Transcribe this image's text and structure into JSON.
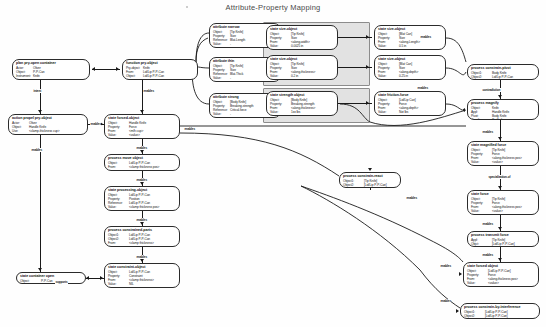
{
  "title": "Attribute-Property Mapping",
  "groups": [
    {
      "name": "mass-size-group",
      "x": 263,
      "y": 22,
      "w": 105,
      "h": 62
    },
    {
      "name": "strength-force-group",
      "x": 263,
      "y": 88,
      "w": 105,
      "h": 33
    }
  ],
  "nodes": [
    {
      "id": "plan-pry-open-container",
      "header": "plan pry-open container",
      "x": 12,
      "y": 59,
      "w": 78,
      "h": 21,
      "narrow": true,
      "slots": [
        {
          "key": "Actor:",
          "value": "Oliver"
        },
        {
          "key": "Object:",
          "value": "P-P-Can"
        },
        {
          "key": "Instrument:",
          "value": "Knife"
        }
      ]
    },
    {
      "id": "function-pry-object",
      "header": "function pry-object",
      "x": 122,
      "y": 59,
      "w": 76,
      "h": 21,
      "narrow": true,
      "slots": [
        {
          "key": "Pry-object:",
          "value": "Knife"
        },
        {
          "key": "From:",
          "value": "Lid/Lip P-P-Can"
        },
        {
          "key": "Object:",
          "value": "Lid/Lip P-P-Can"
        }
      ]
    },
    {
      "id": "action-propel-pry-object",
      "header": "action propel pry-object",
      "x": 8,
      "y": 114,
      "w": 80,
      "h": 21,
      "narrow": true,
      "slots": [
        {
          "key": "Actor:",
          "value": "Oliver"
        },
        {
          "key": "Object:",
          "value": "Handle Knife"
        },
        {
          "key": "Use:",
          "value": "&lt;clamp-thickness cup&gt;"
        }
      ]
    },
    {
      "id": "state-forced-object",
      "header": "state forced-object",
      "x": 104,
      "y": 114,
      "w": 76,
      "h": 25,
      "slots": [
        {
          "key": "Object:",
          "value": "Handle Knife"
        },
        {
          "key": "Property:",
          "value": "Force"
        },
        {
          "key": "From:",
          "value": "&lt;m/h cup&gt;"
        },
        {
          "key": "Value:",
          "value": "&lt;value&gt;"
        }
      ]
    },
    {
      "id": "process-move-object",
      "header": "process move object",
      "x": 104,
      "y": 154,
      "w": 76,
      "h": 17,
      "slots": [
        {
          "key": "Object:",
          "value": "Lid/Lip P-P-Can"
        },
        {
          "key": "From:",
          "value": "&lt;clamp thickness pos&gt;"
        }
      ]
    },
    {
      "id": "state-processing-object",
      "header": "state processing-object",
      "x": 104,
      "y": 186,
      "w": 76,
      "h": 25,
      "slots": [
        {
          "key": "Object:",
          "value": "Lid/Lip P-P-Can"
        },
        {
          "key": "Property:",
          "value": "Position"
        },
        {
          "key": "Reference:",
          "value": "Lid/Lip P-P-Can"
        },
        {
          "key": "Value:",
          "value": "&lt;clamp thickness pos&gt;"
        }
      ]
    },
    {
      "id": "process-constrained-parts",
      "header": "process constrained-parts",
      "x": 104,
      "y": 226,
      "w": 76,
      "h": 21,
      "slots": [
        {
          "key": "Object1:",
          "value": "Lid/Lip P-P-Can"
        },
        {
          "key": "Object2:",
          "value": "Lid/Lip P-P-Can"
        },
        {
          "key": "From:",
          "value": "&lt;clamp thickness&gt;"
        }
      ]
    },
    {
      "id": "state-constraint-object",
      "header": "state constraint-object",
      "x": 104,
      "y": 263,
      "w": 76,
      "h": 25,
      "slots": [
        {
          "key": "Object:",
          "value": "Lid/Lip P-P-Can"
        },
        {
          "key": "Property:",
          "value": "Constraint"
        },
        {
          "key": "From:",
          "value": "&lt;clamp thickness&gt;"
        },
        {
          "key": "Value:",
          "value": "NIL"
        }
      ]
    },
    {
      "id": "state-container-open",
      "header": "state container open",
      "x": 16,
      "y": 272,
      "w": 70,
      "h": 12,
      "slots": [
        {
          "key": "Object:",
          "value": "P-P-Can"
        }
      ]
    },
    {
      "id": "attribute-narrow",
      "header": "attribute narrow",
      "x": 209,
      "y": 23,
      "w": 72,
      "h": 25,
      "narrow": true,
      "slots": [
        {
          "key": "Object:",
          "value": "[Tip Knife]"
        },
        {
          "key": "Property:",
          "value": "Size"
        },
        {
          "key": "Reference:",
          "value": "Blat-Length"
        },
        {
          "key": "Value:",
          "value": "-"
        }
      ]
    },
    {
      "id": "attribute-thin",
      "header": "attribute thin",
      "x": 209,
      "y": 57,
      "w": 72,
      "h": 25,
      "narrow": true,
      "slots": [
        {
          "key": "Object:",
          "value": "[Tip Knife]"
        },
        {
          "key": "Property:",
          "value": "Size"
        },
        {
          "key": "Reference:",
          "value": "Blat-Thick"
        },
        {
          "key": "Value:",
          "value": "-"
        }
      ]
    },
    {
      "id": "attribute-strong",
      "header": "attribute strong",
      "x": 209,
      "y": 93,
      "w": 72,
      "h": 25,
      "narrow": true,
      "slots": [
        {
          "key": "Object:",
          "value": "[Body Knife]"
        },
        {
          "key": "Property:",
          "value": "Breaking-strength"
        },
        {
          "key": "Reference:",
          "value": "Critical-force"
        },
        {
          "key": "Value:",
          "value": "-"
        }
      ]
    },
    {
      "id": "state-size-object-1",
      "header": "state size-object",
      "x": 266,
      "y": 25,
      "w": 72,
      "h": 25,
      "slots": [
        {
          "key": "Object:",
          "value": "[Tip Knife]"
        },
        {
          "key": "Property:",
          "value": "Size"
        },
        {
          "key": "From:",
          "value": "&lt;along-width&gt;"
        },
        {
          "key": "Value:",
          "value": "0.0025 in"
        }
      ]
    },
    {
      "id": "state-size-object-2",
      "header": "state size-object",
      "x": 266,
      "y": 55,
      "w": 72,
      "h": 25,
      "slots": [
        {
          "key": "Object:",
          "value": "[Tip Knife]"
        },
        {
          "key": "Property:",
          "value": "Size"
        },
        {
          "key": "From:",
          "value": "&lt;along-thickness&gt;"
        },
        {
          "key": "Value:",
          "value": "0.2 in"
        }
      ]
    },
    {
      "id": "state-size-object-3",
      "header": "state size-object",
      "x": 374,
      "y": 25,
      "w": 72,
      "h": 25,
      "slots": [
        {
          "key": "Object:",
          "value": "[Blat Can]"
        },
        {
          "key": "Property:",
          "value": "Size"
        },
        {
          "key": "From:",
          "value": "&lt;along-Length&gt;"
        },
        {
          "key": "Value:",
          "value": "0.5 in"
        }
      ]
    },
    {
      "id": "state-size-object-4",
      "header": "state size-object",
      "x": 374,
      "y": 55,
      "w": 72,
      "h": 25,
      "slots": [
        {
          "key": "Object:",
          "value": "[Blat Can]"
        },
        {
          "key": "Property:",
          "value": "Size"
        },
        {
          "key": "From:",
          "value": "&lt;along-depth&gt;"
        },
        {
          "key": "Value:",
          "value": "0.25 in"
        }
      ]
    },
    {
      "id": "state-strength-object",
      "header": "state strength object",
      "x": 266,
      "y": 91,
      "w": 72,
      "h": 25,
      "slots": [
        {
          "key": "Object:",
          "value": "[Body Knife]"
        },
        {
          "key": "Property:",
          "value": "Breaking-strength"
        },
        {
          "key": "From:",
          "value": "&lt;along-thickness&gt;"
        },
        {
          "key": "Value:",
          "value": "1xx lbs"
        }
      ]
    },
    {
      "id": "state-friction-force",
      "header": "state friction-force",
      "x": 374,
      "y": 91,
      "w": 72,
      "h": 25,
      "slots": [
        {
          "key": "Object:",
          "value": "[Lid/Lip Can]"
        },
        {
          "key": "Property:",
          "value": "Force"
        },
        {
          "key": "From:",
          "value": "&lt;along-depth&gt;"
        },
        {
          "key": "Value:",
          "value": "Not lbs"
        }
      ]
    },
    {
      "id": "process-constrain-pivot",
      "header": "process constrain-pivot",
      "x": 467,
      "y": 64,
      "w": 72,
      "h": 16,
      "slots": [
        {
          "key": "Object1:",
          "value": "Body Knife"
        },
        {
          "key": "Object2:",
          "value": "Lid/Lip P-P-Can"
        }
      ]
    },
    {
      "id": "process-magnify",
      "header": "process magnify",
      "x": 467,
      "y": 99,
      "w": 72,
      "h": 21,
      "slots": [
        {
          "key": "Object:",
          "value": "Knife"
        },
        {
          "key": "Appl:",
          "value": "Handle Knife"
        },
        {
          "key": "Pivot:",
          "value": "Body Knife"
        },
        {
          "key": "Result:",
          "value": "Tip Knife"
        }
      ]
    },
    {
      "id": "state-magnified-force",
      "header": "state magnified force",
      "x": 467,
      "y": 141,
      "w": 72,
      "h": 25,
      "slots": [
        {
          "key": "Object:",
          "value": "[Tip Knife]"
        },
        {
          "key": "Property:",
          "value": "Force"
        },
        {
          "key": "From:",
          "value": "&lt;along-thickness pos&gt;"
        },
        {
          "key": "Value:",
          "value": "&lt;value&gt;"
        }
      ]
    },
    {
      "id": "state-force",
      "header": "state force",
      "x": 467,
      "y": 190,
      "w": 72,
      "h": 25,
      "slots": [
        {
          "key": "Object:",
          "value": "[Tip Knife]"
        },
        {
          "key": "Property:",
          "value": "Force"
        },
        {
          "key": "From:",
          "value": "&lt;along-thickness pos&gt;"
        },
        {
          "key": "Value:",
          "value": "&lt;value&gt;"
        }
      ]
    },
    {
      "id": "process-transmit-force",
      "header": "process transmit force",
      "x": 467,
      "y": 231,
      "w": 72,
      "h": 16,
      "slots": [
        {
          "key": "Appl:",
          "value": "[Tip Knife]"
        },
        {
          "key": "Objct:",
          "value": "[Lid/Lip P-P-Can]"
        }
      ]
    },
    {
      "id": "state-forced-object-right",
      "header": "state forced object",
      "x": 463,
      "y": 262,
      "w": 76,
      "h": 25,
      "slots": [
        {
          "key": "Object:",
          "value": "[Lid/Lip P-P-Can]"
        },
        {
          "key": "Property:",
          "value": "Force"
        },
        {
          "key": "From:",
          "value": "&lt;along-thickness pos&gt;"
        },
        {
          "key": "Value:",
          "value": "&lt;value&gt;"
        }
      ]
    },
    {
      "id": "process-constrain-by-interference",
      "header": "process constrain-by-interference",
      "x": 460,
      "y": 303,
      "w": 80,
      "h": 16,
      "slots": [
        {
          "key": "Object1:",
          "value": "[Lid/Lip P-P-Can]"
        },
        {
          "key": "Object2:",
          "value": "[Lid/Lip P-P-Can]"
        }
      ]
    },
    {
      "id": "process-constrain-react",
      "header": "process constrain-react",
      "x": 339,
      "y": 172,
      "w": 62,
      "h": 16,
      "slots": [
        {
          "key": "Object1:",
          "value": "[Tip Knife]"
        },
        {
          "key": "Object2:",
          "value": "[Lid/Lip P-P-Can]"
        }
      ]
    }
  ],
  "edge_labels": [
    {
      "name": "intent",
      "text": "intent",
      "x": 33,
      "y": 89
    },
    {
      "name": "enables-1",
      "text": "enables",
      "x": 143,
      "y": 89
    },
    {
      "name": "enables-2",
      "text": "enables",
      "x": 90,
      "y": 122
    },
    {
      "name": "enables-3",
      "text": "enables",
      "x": 31,
      "y": 148
    },
    {
      "name": "enables-4",
      "text": "enables",
      "x": 136,
      "y": 146
    },
    {
      "name": "enables-5",
      "text": "enables",
      "x": 136,
      "y": 178
    },
    {
      "name": "enables-6",
      "text": "enables",
      "x": 136,
      "y": 218
    },
    {
      "name": "enables-7",
      "text": "enables",
      "x": 136,
      "y": 255
    },
    {
      "name": "supports",
      "text": "supports",
      "x": 55,
      "y": 280
    },
    {
      "name": "enables-right-1",
      "text": "enables",
      "x": 184,
      "y": 127
    },
    {
      "name": "enables-right-2",
      "text": "enables",
      "x": 420,
      "y": 35
    },
    {
      "name": "enables-right-3",
      "text": "enables",
      "x": 417,
      "y": 86
    },
    {
      "name": "contradiction",
      "text": "contradiction",
      "x": 482,
      "y": 88
    },
    {
      "name": "enables-mag",
      "text": "enables",
      "x": 482,
      "y": 130
    },
    {
      "name": "specialization-of",
      "text": "specialization-of",
      "x": 488,
      "y": 175
    },
    {
      "name": "enables-force",
      "text": "enables",
      "x": 482,
      "y": 222
    },
    {
      "name": "enables-transmit",
      "text": "enables",
      "x": 482,
      "y": 253
    },
    {
      "name": "enables-react",
      "text": "enables",
      "x": 406,
      "y": 196
    },
    {
      "name": "enables-interference",
      "text": "enables",
      "x": 440,
      "y": 299
    },
    {
      "name": "enables-low",
      "text": "enables",
      "x": 440,
      "y": 264
    }
  ],
  "colors": {
    "group_fill": "#e2e2e2",
    "node_stroke": "#2b2b2b",
    "edge": "#1a1a1a",
    "title": "#4a4a4a"
  }
}
